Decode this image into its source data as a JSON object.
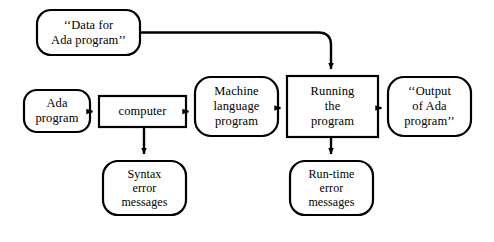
{
  "diagram": {
    "background_color": "#ffffff",
    "stroke_color": "#000000",
    "type": "flowchart",
    "nodes": [
      {
        "id": "data-for-ada-program",
        "shape": "rounded-rectangle",
        "lines": [
          "‘‘Data for",
          "Ada program’’"
        ],
        "x": 37,
        "y": 10,
        "w": 103,
        "h": 45
      },
      {
        "id": "ada-program",
        "shape": "rounded-rectangle",
        "lines": [
          "Ada",
          "program"
        ],
        "x": 24,
        "y": 90,
        "w": 66,
        "h": 42
      },
      {
        "id": "computer",
        "shape": "rectangle",
        "lines": [
          "computer"
        ],
        "x": 99,
        "y": 96,
        "w": 87,
        "h": 31
      },
      {
        "id": "machine-language-program",
        "shape": "rounded-rectangle",
        "lines": [
          "Machine",
          "language",
          "program"
        ],
        "x": 195,
        "y": 77,
        "w": 83,
        "h": 59
      },
      {
        "id": "running-the-program",
        "shape": "rectangle",
        "lines": [
          "Running",
          "the",
          "program"
        ],
        "x": 287,
        "y": 76,
        "w": 91,
        "h": 61
      },
      {
        "id": "output-of-ada-program",
        "shape": "rounded-rectangle",
        "lines": [
          "‘‘Output",
          "of Ada",
          "program’’"
        ],
        "x": 388,
        "y": 77,
        "w": 83,
        "h": 59
      },
      {
        "id": "syntax-error-messages",
        "shape": "rounded-rectangle",
        "lines": [
          "Syntax",
          "error",
          "messages"
        ],
        "x": 103,
        "y": 161,
        "w": 83,
        "h": 54
      },
      {
        "id": "run-time-error-messages",
        "shape": "rounded-rectangle",
        "lines": [
          "Run-time",
          "error",
          "messages"
        ],
        "x": 290,
        "y": 161,
        "w": 83,
        "h": 54
      }
    ],
    "edges": [
      {
        "id": "edge-data-to-running",
        "from": "data-for-ada-program",
        "to": "running-the-program",
        "style": "orthogonal-right-then-down",
        "arrow": true
      },
      {
        "id": "edge-ada-to-computer",
        "from": "ada-program",
        "to": "computer",
        "style": "horizontal",
        "arrow": true
      },
      {
        "id": "edge-computer-to-machine",
        "from": "computer",
        "to": "machine-language-program",
        "style": "horizontal",
        "arrow": true
      },
      {
        "id": "edge-machine-to-running",
        "from": "machine-language-program",
        "to": "running-the-program",
        "style": "horizontal",
        "arrow": true
      },
      {
        "id": "edge-running-to-output",
        "from": "running-the-program",
        "to": "output-of-ada-program",
        "style": "horizontal",
        "arrow": true
      },
      {
        "id": "edge-computer-to-syntax",
        "from": "computer",
        "to": "syntax-error-messages",
        "style": "vertical",
        "arrow": true
      },
      {
        "id": "edge-running-to-runtime",
        "from": "running-the-program",
        "to": "run-time-error-messages",
        "style": "vertical",
        "arrow": true
      }
    ]
  }
}
